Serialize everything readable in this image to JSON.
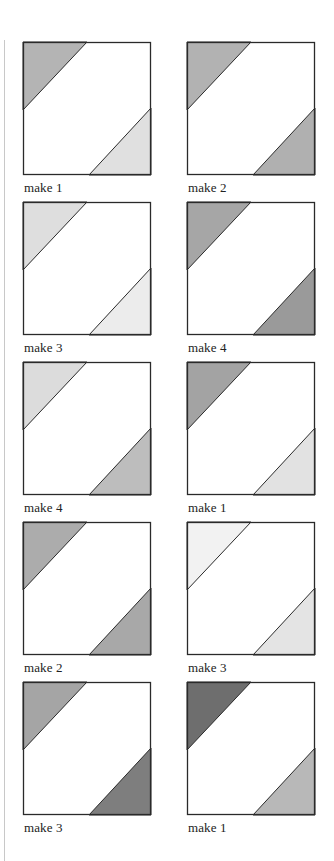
{
  "figure": {
    "colors": {
      "outline": "#2a2a2a",
      "background": "#ffffff",
      "rule": "#c8c8c8",
      "label": "#222222"
    },
    "tiles": [
      {
        "label": "make 1",
        "top_left_fill": "#b4b4b4",
        "bottom_right_fill": "#e0e0e0"
      },
      {
        "label": "make 2",
        "top_left_fill": "#b2b2b2",
        "bottom_right_fill": "#b0b0b0"
      },
      {
        "label": "make 3",
        "top_left_fill": "#dedede",
        "bottom_right_fill": "#ececec"
      },
      {
        "label": "make 4",
        "top_left_fill": "#a6a6a6",
        "bottom_right_fill": "#9a9a9a"
      },
      {
        "label": "make 4",
        "top_left_fill": "#dcdcdc",
        "bottom_right_fill": "#bdbdbd"
      },
      {
        "label": "make 1",
        "top_left_fill": "#a3a3a3",
        "bottom_right_fill": "#e2e2e2"
      },
      {
        "label": "make 2",
        "top_left_fill": "#acacac",
        "bottom_right_fill": "#a8a8a8"
      },
      {
        "label": "make 3",
        "top_left_fill": "#f2f2f2",
        "bottom_right_fill": "#e4e4e4"
      },
      {
        "label": "make 3",
        "top_left_fill": "#a5a5a5",
        "bottom_right_fill": "#7e7e7e"
      },
      {
        "label": "make 1",
        "top_left_fill": "#6e6e6e",
        "bottom_right_fill": "#b8b8b8"
      }
    ]
  }
}
